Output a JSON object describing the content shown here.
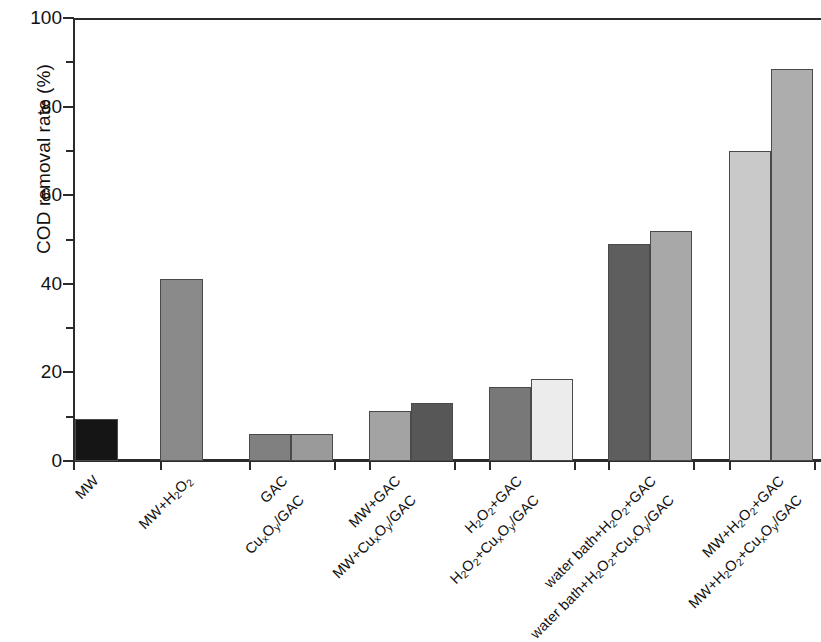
{
  "chart_data": {
    "type": "bar",
    "title": "",
    "xlabel": "",
    "ylabel": "COD removal rate (%)",
    "ylim": [
      0,
      100
    ],
    "ytick_labels": [
      "0",
      "20",
      "40",
      "60",
      "80",
      "100"
    ],
    "ytick_values": [
      0,
      20,
      40,
      60,
      80,
      100
    ],
    "minor_ytick_values": [
      10,
      30,
      50,
      70,
      90
    ],
    "grid": false,
    "legend": "none",
    "categories": [
      "MW",
      "MW+H2O2",
      "GAC",
      "CuxOy/GAC",
      "MW+GAC",
      "MW+CuxOy/GAC",
      "H2O2+GAC",
      "H2O2+CuxOy/GAC",
      "water bath+H2O2+GAC",
      "water bath+H2O2+CuxOy/GAC",
      "MW+H2O2+GAC",
      "MW+H2O2+CuxOy/GAC"
    ],
    "values": [
      9.5,
      41.0,
      6.2,
      6.2,
      11.2,
      13.0,
      16.8,
      18.5,
      49.0,
      52.0,
      70.0,
      88.5
    ],
    "bar_colors": [
      "#151515",
      "#8a8a8a",
      "#808080",
      "#9a9a9a",
      "#a3a3a3",
      "#575757",
      "#787878",
      "#ececec",
      "#5e5e5e",
      "#a8a8a8",
      "#c9c9c9",
      "#adadad"
    ],
    "bar_edge_color": "#4a4a4a",
    "axis_color": "#2b2b2b",
    "background_color": "#ffffff"
  },
  "axis_labels": {
    "y_title_pre": "COD removal rate (%)"
  },
  "x_category_labels": [
    {
      "id": "mw",
      "html": "MW"
    },
    {
      "id": "mw-h2o2",
      "html": "MW+H<sub>2</sub>O<sub>2</sub>"
    },
    {
      "id": "gac",
      "html": "GAC"
    },
    {
      "id": "cuxoy-gac",
      "html": "Cu<sub>x</sub>O<sub>y</sub>/GAC"
    },
    {
      "id": "mw-gac",
      "html": "MW+GAC"
    },
    {
      "id": "mw-cuxoy-gac",
      "html": "MW+Cu<sub>x</sub>O<sub>y</sub>/GAC"
    },
    {
      "id": "h2o2-gac",
      "html": "H<sub>2</sub>O<sub>2</sub>+GAC"
    },
    {
      "id": "h2o2-cuxoy-gac",
      "html": "H<sub>2</sub>O<sub>2</sub>+Cu<sub>x</sub>O<sub>y</sub>/GAC"
    },
    {
      "id": "wb-h2o2-gac",
      "html": "water bath+H<sub>2</sub>O<sub>2</sub>+GAC"
    },
    {
      "id": "wb-h2o2-cuxoy-gac",
      "html": "water bath+H<sub>2</sub>O<sub>2</sub>+Cu<sub>x</sub>O<sub>y</sub>/GAC"
    },
    {
      "id": "mw-h2o2-gac",
      "html": "MW+H<sub>2</sub>O<sub>2</sub>+GAC"
    },
    {
      "id": "mw-h2o2-cuxoy-gac",
      "html": "MW+H<sub>2</sub>O<sub>2</sub>+Cu<sub>x</sub>O<sub>y</sub>/GAC"
    }
  ],
  "layout": {
    "bar_left_px": [
      2,
      87,
      176,
      218,
      296,
      338,
      416,
      458,
      535,
      577,
      656,
      698
    ],
    "bar_width_px": [
      43,
      43,
      42,
      42,
      42,
      42,
      42,
      42,
      42,
      42,
      42,
      42
    ],
    "xlabel_anchor_px": [
      {
        "x": 96,
        "y": 470
      },
      {
        "x": 190,
        "y": 470
      },
      {
        "x": 285,
        "y": 470
      },
      {
        "x": 302,
        "y": 489
      },
      {
        "x": 398,
        "y": 470
      },
      {
        "x": 414,
        "y": 489
      },
      {
        "x": 520,
        "y": 470
      },
      {
        "x": 537,
        "y": 489
      },
      {
        "x": 654,
        "y": 470
      },
      {
        "x": 672,
        "y": 489
      },
      {
        "x": 782,
        "y": 470
      },
      {
        "x": 800,
        "y": 489
      }
    ]
  }
}
